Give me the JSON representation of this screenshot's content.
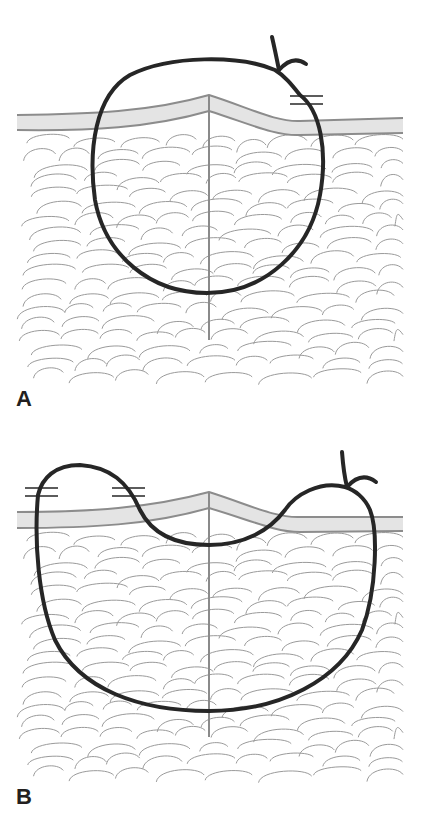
{
  "figure": {
    "panels": [
      {
        "id": "A",
        "label": "A",
        "description": "Simple interrupted suture loop encircling the wound; knot tied at upper right",
        "elements": [
          "skin-layer",
          "subcutaneous-fat-lobules",
          "wound-midline",
          "suture-loop",
          "suture-knot",
          "break-marks"
        ]
      },
      {
        "id": "B",
        "label": "B",
        "description": "Suture loop with wide deep bite and superficial dip across wound; two break marks on left",
        "elements": [
          "skin-layer",
          "subcutaneous-fat-lobules",
          "wound-midline",
          "suture-loop",
          "suture-knot",
          "break-marks"
        ]
      }
    ],
    "colors": {
      "suture": "#262626",
      "skin_fill": "#e4e4e4",
      "skin_edge": "#8c8c8c",
      "tissue_lines": "#9a9a9a",
      "midline": "#8a8a8a",
      "background": "#ffffff",
      "label": "#231f20"
    }
  }
}
